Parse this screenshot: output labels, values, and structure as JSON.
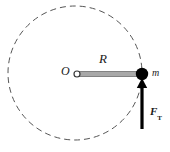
{
  "figure": {
    "type": "physics-free-body-diagram",
    "background_color": "#ffffff",
    "labels": {
      "center": "O",
      "radius": "R",
      "mass": "m",
      "force_symbol": "F",
      "force_subscript": "T"
    },
    "colors": {
      "circle_stroke": "#555555",
      "rod_fill": "#a8a8a8",
      "rod_stroke": "#6e6e6e",
      "mass_fill": "#000000",
      "arrow_fill": "#000000",
      "text": "#1a1a1a"
    },
    "geometry": {
      "circle_center_x": 75,
      "circle_center_y": 73,
      "circle_radius": 67,
      "circle_dashed": true,
      "mass_x": 142,
      "mass_y": 74,
      "mass_radius": 6,
      "center_marker_radius": 3,
      "rod_left_x": 79,
      "rod_right_x": 142,
      "rod_y": 74,
      "rod_thickness": 5,
      "arrow_x": 142,
      "arrow_tail_y": 129,
      "arrow_head_y": 82
    }
  }
}
